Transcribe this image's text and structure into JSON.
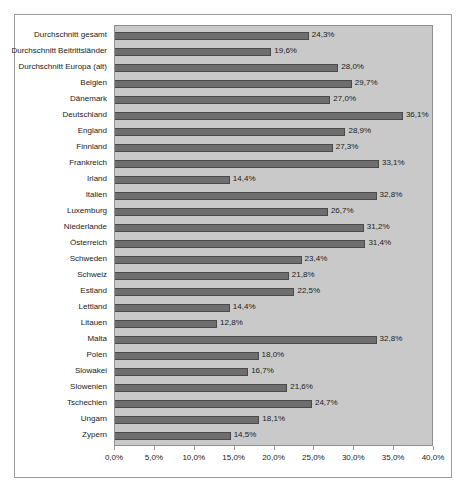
{
  "chart_data": {
    "type": "bar",
    "orientation": "horizontal",
    "title": "",
    "xlabel": "",
    "ylabel": "",
    "xlim": [
      0,
      40
    ],
    "grid": false,
    "legend": "none",
    "value_suffix": "%",
    "decimal_separator": ",",
    "xticks": [
      "0,0%",
      "5,0%",
      "10,0%",
      "15,0%",
      "20,0%",
      "25,0%",
      "30,0%",
      "35,0%",
      "40,0%"
    ],
    "xtick_values": [
      0,
      5,
      10,
      15,
      20,
      25,
      30,
      35,
      40
    ],
    "categories": [
      "Durchschnitt gesamt",
      "Durchschnitt Beitrittsländer",
      "Durchschnitt Europa (alt)",
      "Belgien",
      "Dänemark",
      "Deutschland",
      "England",
      "Finnland",
      "Frankreich",
      "Irland",
      "Italien",
      "Luxemburg",
      "Niederlande",
      "Österreich",
      "Schweden",
      "Schweiz",
      "Estland",
      "Lettland",
      "Litauen",
      "Malta",
      "Polen",
      "Slowakei",
      "Slowenien",
      "Tschechien",
      "Ungarn",
      "Zypern"
    ],
    "values": [
      24.3,
      19.6,
      28.0,
      29.7,
      27.0,
      36.1,
      28.9,
      27.3,
      33.1,
      14.4,
      32.8,
      26.7,
      31.2,
      31.4,
      23.4,
      21.8,
      22.5,
      14.4,
      12.8,
      32.8,
      18.0,
      16.7,
      21.6,
      24.7,
      18.1,
      14.5
    ],
    "value_labels": [
      "24,3%",
      "19,6%",
      "28,0%",
      "29,7%",
      "27,0%",
      "36,1%",
      "28,9%",
      "27,3%",
      "33,1%",
      "14,4%",
      "32,8%",
      "26,7%",
      "31,2%",
      "31,4%",
      "23,4%",
      "21,8%",
      "22,5%",
      "14,4%",
      "12,8%",
      "32,8%",
      "18,0%",
      "16,7%",
      "21,6%",
      "24,7%",
      "18,1%",
      "14,5%"
    ],
    "colors": {
      "bar_fill": "#6e6e6e",
      "bar_border": "#4a4a4a",
      "plot_background": "#c9c9c9",
      "frame_border": "#9a9a9a",
      "text": "#1a1a1a",
      "page_background": "#ffffff"
    }
  }
}
